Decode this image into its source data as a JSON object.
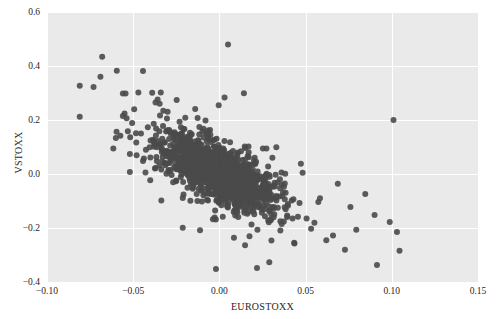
{
  "chart_data": {
    "type": "scatter",
    "title": "",
    "xlabel": "EUROSTOXX",
    "ylabel": "VSTOXX",
    "xlim": [
      -0.1,
      0.15
    ],
    "ylim": [
      -0.4,
      0.6
    ],
    "xticks": [
      -0.1,
      -0.05,
      0.0,
      0.05,
      0.1,
      0.15
    ],
    "xtick_labels": [
      "−0.10",
      "−0.05",
      "0.00",
      "0.05",
      "0.10",
      "0.15"
    ],
    "yticks": [
      -0.4,
      -0.2,
      0.0,
      0.2,
      0.4,
      0.6
    ],
    "ytick_labels": [
      "−0.4",
      "−0.2",
      "0.0",
      "0.2",
      "0.4",
      "0.6"
    ],
    "grid": true,
    "legend": null,
    "style": {
      "axes_facecolor": "#eaeaea",
      "figure_facecolor": "#ffffff",
      "gridcolor": "#ffffff",
      "point_color": "#4a4a4a",
      "point_size": 4.2,
      "point_alpha": 0.9,
      "text_color": "#262626"
    },
    "n_points": 1520,
    "correlation": -0.66,
    "series": [
      {
        "name": "EUROSTOXX vs VSTOXX daily log returns",
        "x_mean": -0.0005,
        "x_std": 0.0155,
        "y_mean": 0.004,
        "y_std": 0.066,
        "cluster_description": "dense elliptical cloud centered near (0.00, 0.00) with strong negative slope",
        "outliers": [
          {
            "x": 0.005,
            "y": 0.48
          },
          {
            "x": -0.068,
            "y": 0.434
          },
          {
            "x": -0.081,
            "y": 0.327
          },
          {
            "x": -0.073,
            "y": 0.322
          },
          {
            "x": -0.056,
            "y": 0.298
          },
          {
            "x": -0.047,
            "y": 0.302
          },
          {
            "x": -0.039,
            "y": 0.301
          },
          {
            "x": -0.034,
            "y": 0.302
          },
          {
            "x": -0.081,
            "y": 0.212
          },
          {
            "x": -0.056,
            "y": 0.215
          },
          {
            "x": 0.101,
            "y": 0.2
          },
          {
            "x": -0.002,
            "y": -0.352
          },
          {
            "x": 0.103,
            "y": -0.215
          },
          {
            "x": 0.062,
            "y": -0.245
          },
          {
            "x": 0.09,
            "y": -0.152
          },
          {
            "x": 0.076,
            "y": -0.122
          }
        ]
      }
    ]
  }
}
